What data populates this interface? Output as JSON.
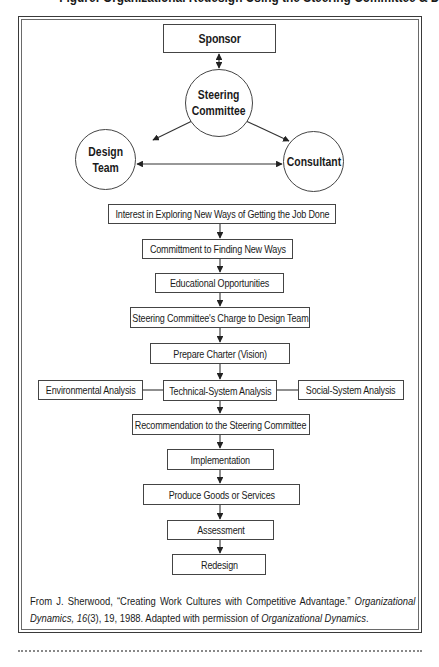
{
  "figure": {
    "title_cut_off": "Figure: Organizational Redesign Using the Steering Committee & Design Team"
  },
  "top_nodes": {
    "sponsor": "Sponsor",
    "steering_committee": "Steering\nCommittee",
    "design_team": "Design\nTeam",
    "consultant": "Consultant"
  },
  "flow_steps": [
    "Interest in Exploring New Ways of Getting the Job Done",
    "Committment to Finding New Ways",
    "Educational Opportunities",
    "Steering Committee's Charge to Design Team",
    "Prepare Charter (Vision)",
    "Technical-System Analysis",
    "Recommendation to the Steering Committee",
    "Implementation",
    "Produce Goods or Services",
    "Assessment",
    "Redesign"
  ],
  "side_analyses": {
    "left": "Environmental Analysis",
    "right": "Social-System Analysis"
  },
  "edges": [
    {
      "from": "Sponsor",
      "to": "Steering Committee",
      "type": "bidirectional"
    },
    {
      "from": "Steering Committee",
      "to": "Design Team",
      "type": "directed"
    },
    {
      "from": "Steering Committee",
      "to": "Consultant",
      "type": "directed"
    },
    {
      "from": "Design Team",
      "to": "Consultant",
      "type": "bidirectional"
    },
    {
      "from": "Environmental Analysis",
      "to": "Technical-System Analysis",
      "type": "line"
    },
    {
      "from": "Technical-System Analysis",
      "to": "Social-System Analysis",
      "type": "line"
    }
  ],
  "citation": {
    "prefix": "From J. Sherwood, “Creating Work Cultures with Competitive Advantage.” ",
    "journal": "Organizational Dynamics,",
    "volume": "16",
    "issue_pages_year": "(3), 19, 1988. Adapted with permission of ",
    "journal2": "Organizational Dynamics",
    "end": "."
  },
  "colors": {
    "stroke": "#444444",
    "text": "#1a1a1a",
    "background": "#ffffff"
  }
}
